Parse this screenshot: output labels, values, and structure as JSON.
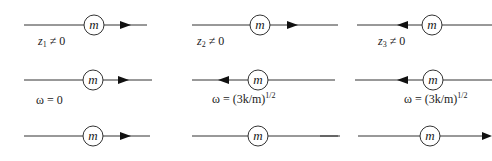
{
  "diagram": {
    "title": "",
    "mass_symbol": "m",
    "rows": [
      {
        "cells": [
          {
            "label_var": "z",
            "label_sub": "1",
            "label_rest": " ≠ 0",
            "arrow": "right"
          },
          {
            "label_var": "z",
            "label_sub": "2",
            "label_rest": " ≠ 0",
            "arrow": "right"
          },
          {
            "label_var": "z",
            "label_sub": "3",
            "label_rest": " ≠ 0",
            "arrow": "left"
          }
        ]
      },
      {
        "label_prefix": "ω = ",
        "cells": [
          {
            "label": "ω = 0",
            "arrow": "right"
          },
          {
            "label_main": "ω = (3k/m)",
            "label_sup": "1/2",
            "arrow": "left"
          },
          {
            "label_main": "ω = (3k/m)",
            "label_sup": "1/2",
            "arrow": "left"
          }
        ]
      },
      {
        "cells": [
          {
            "label": "",
            "arrow": "right"
          },
          {
            "label": "",
            "arrow": "none"
          },
          {
            "label": "",
            "arrow": "right-end"
          }
        ]
      }
    ],
    "stroke_color": "#333333"
  }
}
